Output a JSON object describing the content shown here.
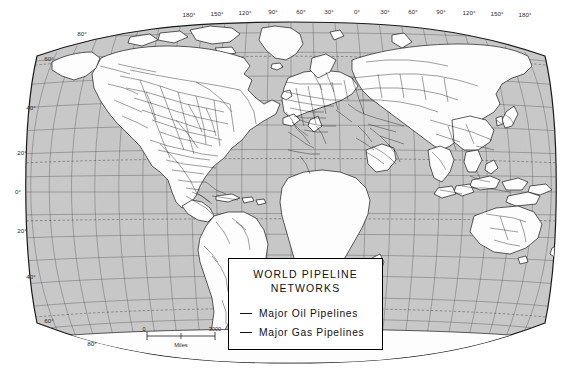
{
  "map": {
    "projection": "robinson",
    "ocean_color": "#c9c9c9",
    "land_color": "#fdfdfd",
    "graticule_color": "#555555",
    "coast_color": "#1a1a1a",
    "pipeline_color": "#111111",
    "background": "#ffffff",
    "longitude_labels": [
      "180°",
      "150°",
      "120°",
      "90°",
      "60°",
      "30°",
      "0°",
      "30°",
      "60°",
      "90°",
      "120°",
      "150°",
      "180°"
    ],
    "latitude_labels_left": [
      "80°",
      "60°",
      "40°",
      "20°",
      "0°",
      "20°",
      "40°",
      "60°",
      "80°"
    ],
    "graticule_interval_deg": 15
  },
  "scale_bar": {
    "start_label": "0",
    "end_label": "3000",
    "unit_label": "Miles"
  },
  "legend": {
    "title_line1": "WORLD  PIPELINE",
    "title_line2": "NETWORKS",
    "items": [
      {
        "label": "Major Oil Pipelines",
        "swatch": "line-swatch-oil"
      },
      {
        "label": "Major Gas Pipelines",
        "swatch": "line-swatch-gas"
      }
    ]
  }
}
